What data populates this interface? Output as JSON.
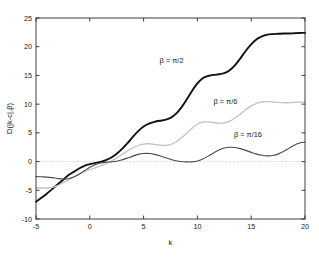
{
  "chart_data": {
    "type": "line",
    "title": "",
    "xlabel": "k",
    "ylabel": "D(|k-c|,β)",
    "xlim": [
      -5,
      20
    ],
    "ylim": [
      -10,
      25
    ],
    "xticks": [
      -5,
      0,
      5,
      10,
      15,
      20
    ],
    "yticks": [
      -10,
      -5,
      0,
      5,
      10,
      15,
      20,
      25
    ],
    "xticklabels": [
      "-5",
      "0",
      "5",
      "10",
      "15",
      "20"
    ],
    "yticklabels": [
      "-10",
      "-5",
      "0",
      "5",
      "10",
      "15",
      "20",
      "25"
    ],
    "grid": false,
    "legend_position": "inline-annotations",
    "reference_lines": [
      {
        "axis": "y",
        "value": 0,
        "style": "dotted",
        "color": "#b9b9b9"
      }
    ],
    "x": [
      -5,
      -4.5,
      -4,
      -3.5,
      -3,
      -2.5,
      -2,
      -1.5,
      -1,
      -0.5,
      0,
      0.5,
      1,
      1.5,
      2,
      2.5,
      3,
      3.5,
      4,
      4.5,
      5,
      5.5,
      6,
      6.5,
      7,
      7.5,
      8,
      8.5,
      9,
      9.5,
      10,
      10.5,
      11,
      11.5,
      12,
      12.5,
      13,
      13.5,
      14,
      14.5,
      15,
      15.5,
      16,
      16.5,
      17,
      17.5,
      18,
      18.5,
      19,
      19.5,
      20
    ],
    "series": [
      {
        "name": "β = π/2",
        "label": "β = π/2",
        "color": "#111111",
        "linewidth": 1.9,
        "values": [
          -7.0,
          -6.3,
          -5.6,
          -4.8,
          -4.0,
          -3.2,
          -2.4,
          -1.8,
          -1.2,
          -0.75,
          -0.45,
          -0.25,
          -0.05,
          0.25,
          0.7,
          1.35,
          2.2,
          3.2,
          4.3,
          5.3,
          6.1,
          6.6,
          6.9,
          7.1,
          7.25,
          7.6,
          8.3,
          9.4,
          10.8,
          12.3,
          13.6,
          14.5,
          14.9,
          15.1,
          15.2,
          15.4,
          15.9,
          16.8,
          18.0,
          19.3,
          20.4,
          21.3,
          21.8,
          22.1,
          22.2,
          22.25,
          22.3,
          22.3,
          22.35,
          22.4,
          22.4
        ]
      },
      {
        "name": "β = π/6",
        "label": "β = π/6",
        "color": "#c2c2c2",
        "linewidth": 1.3,
        "values": [
          -4.6,
          -4.6,
          -4.6,
          -4.5,
          -4.2,
          -3.7,
          -3.2,
          -2.7,
          -2.2,
          -1.75,
          -1.4,
          -1.1,
          -0.75,
          -0.35,
          0.1,
          0.65,
          1.25,
          1.85,
          2.4,
          2.8,
          3.05,
          3.1,
          3.0,
          2.85,
          2.8,
          2.95,
          3.4,
          4.1,
          4.95,
          5.8,
          6.5,
          6.85,
          6.9,
          6.8,
          6.7,
          6.75,
          7.05,
          7.6,
          8.3,
          9.05,
          9.7,
          10.15,
          10.4,
          10.45,
          10.4,
          10.3,
          10.25,
          10.25,
          10.3,
          10.35,
          10.35
        ]
      },
      {
        "name": "β = π/16",
        "label": "β = π/16",
        "color": "#4a4a4a",
        "linewidth": 1.1,
        "values": [
          -2.6,
          -2.65,
          -2.7,
          -2.8,
          -2.95,
          -3.05,
          -3.0,
          -2.7,
          -2.2,
          -1.6,
          -1.0,
          -0.55,
          -0.25,
          -0.1,
          -0.05,
          0.05,
          0.3,
          0.6,
          0.95,
          1.25,
          1.4,
          1.4,
          1.25,
          1.0,
          0.7,
          0.4,
          0.15,
          0.0,
          -0.05,
          -0.05,
          0.1,
          0.45,
          0.95,
          1.5,
          2.0,
          2.35,
          2.5,
          2.45,
          2.25,
          1.95,
          1.6,
          1.3,
          1.1,
          1.0,
          1.05,
          1.3,
          1.75,
          2.3,
          2.85,
          3.25,
          3.4
        ]
      }
    ],
    "annotations": [
      {
        "text": "β = π/2",
        "x": 7.6,
        "y": 17.2,
        "name": "annotation-beta-pi-over-2"
      },
      {
        "text": "β = π/6",
        "x": 12.6,
        "y": 10.1,
        "name": "annotation-beta-pi-over-6"
      },
      {
        "text": "β = π/16",
        "x": 14.7,
        "y": 4.3,
        "name": "annotation-beta-pi-over-16"
      }
    ]
  },
  "figure": {
    "background_color": "#ffffff",
    "axis_color": "#2b2b2b"
  }
}
